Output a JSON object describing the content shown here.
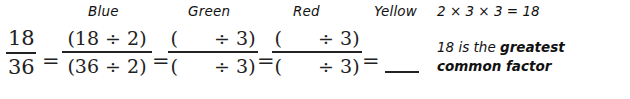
{
  "labels": [
    {
      "name": "blue",
      "text": "Blue",
      "x": 88
    },
    {
      "name": "green",
      "text": "Green",
      "x": 188
    },
    {
      "name": "red",
      "text": "Red",
      "x": 293
    },
    {
      "name": "yellow",
      "text": "Yellow",
      "x": 374
    }
  ],
  "top_note": {
    "text": "2 × 3 × 3 = 18"
  },
  "equation": {
    "fractions": [
      {
        "name": "original-fraction",
        "numerator": "18",
        "denominator": "36",
        "x": 6,
        "width": 30
      },
      {
        "name": "blue-fraction",
        "numerator": "(18 ÷ 2)",
        "denominator": "(36 ÷ 2)",
        "x": 62,
        "width": 90
      },
      {
        "name": "green-fraction",
        "numerator": "(      ÷ 3)",
        "denominator": "(      ÷ 3)",
        "x": 168,
        "width": 90
      },
      {
        "name": "red-fraction",
        "numerator": "(      ÷ 3)",
        "denominator": "(      ÷ 3)",
        "x": 272,
        "width": 90
      }
    ],
    "equals_signs": [
      {
        "name": "equals-1",
        "text": "=",
        "x": 42
      },
      {
        "name": "equals-2",
        "text": "=",
        "x": 152
      },
      {
        "name": "equals-3",
        "text": "=",
        "x": 257
      },
      {
        "name": "equals-4",
        "text": "=",
        "x": 362
      }
    ],
    "answer_blank": {
      "name": "yellow-answer-blank",
      "x": 385
    }
  },
  "explanation": {
    "lead": "18 is the ",
    "emphasis": "greatest common factor"
  },
  "colors": {
    "ink": "#222222",
    "text": "#111111",
    "background": "#ffffff"
  }
}
